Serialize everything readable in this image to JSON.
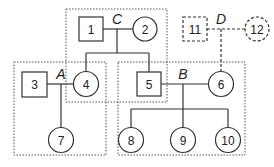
{
  "diagram": {
    "type": "pedigree",
    "colors": {
      "stroke": "#333333",
      "group_border": "#555555",
      "background": "#ffffff"
    },
    "nodes": [
      {
        "id": "1",
        "label": "1",
        "shape": "square",
        "style": "solid"
      },
      {
        "id": "2",
        "label": "2",
        "shape": "circle",
        "style": "solid"
      },
      {
        "id": "3",
        "label": "3",
        "shape": "square",
        "style": "solid"
      },
      {
        "id": "4",
        "label": "4",
        "shape": "circle",
        "style": "solid"
      },
      {
        "id": "5",
        "label": "5",
        "shape": "square",
        "style": "solid"
      },
      {
        "id": "6",
        "label": "6",
        "shape": "circle",
        "style": "solid"
      },
      {
        "id": "7",
        "label": "7",
        "shape": "circle",
        "style": "solid"
      },
      {
        "id": "8",
        "label": "8",
        "shape": "circle",
        "style": "solid"
      },
      {
        "id": "9",
        "label": "9",
        "shape": "circle",
        "style": "solid"
      },
      {
        "id": "10",
        "label": "10",
        "shape": "circle",
        "style": "solid"
      },
      {
        "id": "11",
        "label": "11",
        "shape": "square",
        "style": "dashed"
      },
      {
        "id": "12",
        "label": "12",
        "shape": "circle",
        "style": "dashed"
      }
    ],
    "couples": [
      {
        "label": "A",
        "partners": [
          "3",
          "4"
        ],
        "children": [
          "7"
        ]
      },
      {
        "label": "B",
        "partners": [
          "5",
          "6"
        ],
        "children": [
          "8",
          "9",
          "10"
        ]
      },
      {
        "label": "C",
        "partners": [
          "1",
          "2"
        ],
        "children": [
          "4",
          "5"
        ]
      },
      {
        "label": "D",
        "partners": [
          "11",
          "12"
        ],
        "children": [
          "6"
        ],
        "style": "dashed"
      }
    ],
    "groups": [
      {
        "id": "group-C",
        "contains": [
          "1",
          "2",
          "4",
          "5"
        ]
      },
      {
        "id": "group-A",
        "contains": [
          "3",
          "4",
          "7"
        ]
      },
      {
        "id": "group-B",
        "contains": [
          "5",
          "6",
          "8",
          "9",
          "10"
        ]
      }
    ]
  }
}
